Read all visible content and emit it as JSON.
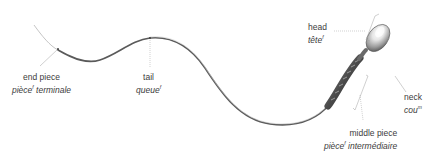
{
  "diagram": {
    "colors": {
      "background": "#ffffff",
      "label_text": "#3c3c3c",
      "leader_line": "#9a9a9a",
      "tail_dark": "#4a4a4a",
      "tail_light": "#b8b8b8",
      "head_highlight": "#f4f4f4",
      "head_shadow": "#5a5a5a"
    },
    "labels": [
      {
        "id": "end-piece",
        "en": "end piece",
        "fr_word": "pièce",
        "fr_gender": "f",
        "fr_rest": " terminale"
      },
      {
        "id": "tail",
        "en": "tail",
        "fr_word": "queue",
        "fr_gender": "f",
        "fr_rest": ""
      },
      {
        "id": "head",
        "en": "head",
        "fr_word": "tête",
        "fr_gender": "f",
        "fr_rest": ""
      },
      {
        "id": "neck",
        "en": "neck",
        "fr_word": "cou",
        "fr_gender": "m",
        "fr_rest": ""
      },
      {
        "id": "middle-piece",
        "en": "middle piece",
        "fr_word": "pièce",
        "fr_gender": "f",
        "fr_rest": " intermédiaire"
      }
    ]
  }
}
